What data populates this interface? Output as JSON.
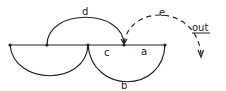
{
  "diagram": {
    "type": "arc-diagram",
    "baseline": {
      "y": 45,
      "x_start": 10,
      "x_end": 165
    },
    "nodes": [
      {
        "id": "n1",
        "x": 10,
        "y": 45
      },
      {
        "id": "n2",
        "x": 47,
        "y": 45
      },
      {
        "id": "n3",
        "x": 88,
        "y": 45
      },
      {
        "id": "n4",
        "x": 124,
        "y": 45
      },
      {
        "id": "n5",
        "x": 165,
        "y": 45
      }
    ],
    "edges": [
      {
        "label": "d",
        "from": "n2",
        "to": "n4",
        "side": "above",
        "style": "solid"
      },
      {
        "label": "c",
        "from": "n3",
        "to": "n4",
        "side": "baseline",
        "style": "solid"
      },
      {
        "label": "a",
        "from": "n4",
        "to": "n5",
        "side": "baseline",
        "style": "solid"
      },
      {
        "label": "b",
        "from": "n3",
        "to": "n5",
        "side": "below",
        "style": "solid"
      },
      {
        "label": "",
        "from": "n1",
        "to": "n3",
        "side": "below",
        "style": "solid"
      },
      {
        "label": "e",
        "from": "n4",
        "to": "out",
        "side": "above",
        "style": "dashed",
        "arrow": true
      }
    ],
    "labels": {
      "d": "d",
      "e": "e",
      "out": "out",
      "c": "c",
      "a": "a",
      "b": "b"
    },
    "colors": {
      "stroke": "#222222",
      "background": "#ffffff"
    }
  }
}
